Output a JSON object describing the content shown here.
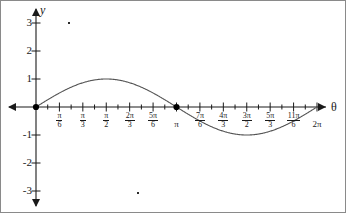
{
  "figure": {
    "name": "sine-curve-graph",
    "background_color": "#ffffff",
    "axis_color": "#1a1a1a",
    "curve_color": "#555555",
    "point_color": "#000000",
    "border_color": "#8a8a8a"
  },
  "axes": {
    "x_axis_label": "θ",
    "y_axis_label": "y",
    "y_ticks": [
      {
        "value": 3,
        "label": "3"
      },
      {
        "value": 2,
        "label": "2"
      },
      {
        "value": 1,
        "label": "1"
      },
      {
        "value": -1,
        "label": "-1"
      },
      {
        "value": -2,
        "label": "-2"
      },
      {
        "value": -3,
        "label": "-3"
      }
    ],
    "x_ticks": [
      {
        "value": 0.5235987756,
        "num": "π",
        "den": "6",
        "plain": null
      },
      {
        "value": 1.0471975512,
        "num": "π",
        "den": "3",
        "plain": null
      },
      {
        "value": 1.5707963268,
        "num": "π",
        "den": "2",
        "plain": null
      },
      {
        "value": 2.0943951024,
        "num": "2π",
        "den": "3",
        "plain": null
      },
      {
        "value": 2.617993878,
        "num": "5π",
        "den": "6",
        "plain": null
      },
      {
        "value": 3.1415926536,
        "num": null,
        "den": null,
        "plain": "π"
      },
      {
        "value": 3.6651914292,
        "num": "7π",
        "den": "6",
        "plain": null
      },
      {
        "value": 4.1887902048,
        "num": "4π",
        "den": "3",
        "plain": null
      },
      {
        "value": 4.7123889804,
        "num": "3π",
        "den": "2",
        "plain": null
      },
      {
        "value": 5.235987756,
        "num": "5π",
        "den": "3",
        "plain": null
      },
      {
        "value": 5.7595865316,
        "num": "11π",
        "den": "6",
        "plain": null
      },
      {
        "value": 6.2831853072,
        "num": null,
        "den": null,
        "plain": "2π"
      }
    ],
    "minor_tick_step": 0.2617993878
  },
  "chart_data": {
    "type": "line",
    "title": "",
    "xlabel": "θ",
    "ylabel": "y",
    "xlim": [
      0,
      6.2831853072
    ],
    "ylim": [
      -3,
      3
    ],
    "grid": false,
    "legend": null,
    "series": [
      {
        "name": "y = sin(θ)",
        "expression": "sin(theta)",
        "x": [
          0,
          0.2618,
          0.5236,
          0.7854,
          1.0472,
          1.309,
          1.5708,
          1.8326,
          2.0944,
          2.3562,
          2.618,
          2.8798,
          3.1416,
          3.4034,
          3.6652,
          3.927,
          4.1888,
          4.4506,
          4.7124,
          4.9742,
          5.236,
          5.4978,
          5.7596,
          6.0214,
          6.2832
        ],
        "y": [
          0,
          0.259,
          0.5,
          0.707,
          0.866,
          0.966,
          1.0,
          0.966,
          0.866,
          0.707,
          0.5,
          0.259,
          0,
          -0.259,
          -0.5,
          -0.707,
          -0.866,
          -0.966,
          -1.0,
          -0.966,
          -0.866,
          -0.707,
          -0.5,
          -0.259,
          0
        ]
      }
    ],
    "marked_points": [
      {
        "label": "origin-point",
        "x": 0,
        "y": 0
      },
      {
        "label": "pi-zero-point",
        "x": 3.1415926536,
        "y": 0
      }
    ],
    "annotations": [
      {
        "name": "speck-artifact-upper",
        "x_px": 68,
        "y_px": 22
      },
      {
        "name": "speck-artifact-lower",
        "x_px": 137,
        "y_px": 192
      }
    ]
  }
}
